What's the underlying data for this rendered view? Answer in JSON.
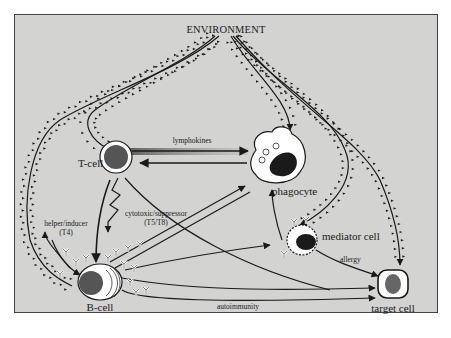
{
  "diagram": {
    "title": "ENVIRONMENT",
    "nodes": {
      "tcell": "T-cell",
      "phagocyte": "phagocyte",
      "bcell": "B-cell",
      "mediator": "mediator cell",
      "target": "target cell"
    },
    "edge_labels": {
      "lymphokines": "lymphokines",
      "helper_line1": "helper/inducer",
      "helper_line2": "(T4)",
      "cyto_line1": "cytotoxic/suppressor",
      "cyto_line2": "(T5/T8)",
      "allergy": "allergy",
      "autoimmunity": "autoimmunity"
    },
    "colors": {
      "background": "#d3d3d1",
      "ink": "#1a1a1a",
      "nucleus": "#333333",
      "cell_fill": "#ffffff"
    }
  }
}
